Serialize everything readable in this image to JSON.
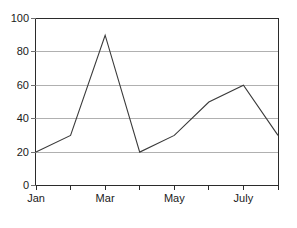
{
  "chart_data": {
    "type": "line",
    "title": "",
    "xlabel": "",
    "ylabel": "",
    "categories": [
      "Jan",
      "Feb",
      "Mar",
      "Apr",
      "May",
      "Jun",
      "July",
      "Aug"
    ],
    "values": [
      20,
      30,
      90,
      20,
      30,
      50,
      60,
      30
    ],
    "series": [
      {
        "name": "series-1",
        "values": [
          20,
          30,
          90,
          20,
          30,
          50,
          60,
          30
        ],
        "color": "#3a3a3a"
      }
    ],
    "ylim": [
      0,
      100
    ],
    "yticks": [
      0,
      20,
      40,
      60,
      80,
      100
    ],
    "ytick_labels": [
      "0",
      "20",
      "40",
      "60",
      "80",
      "100"
    ],
    "xtick_labels": [
      "Jan",
      "",
      "Mar",
      "",
      "May",
      "",
      "July",
      ""
    ],
    "xtick_labels_visible": [
      "Jan",
      "Mar",
      "May",
      "July"
    ],
    "grid": true,
    "grid_axis": "y",
    "grid_color": "#b0b0b0",
    "legend": false,
    "legend_position": "none",
    "border_color": "#2b2b2b",
    "background_color": "#ffffff"
  }
}
